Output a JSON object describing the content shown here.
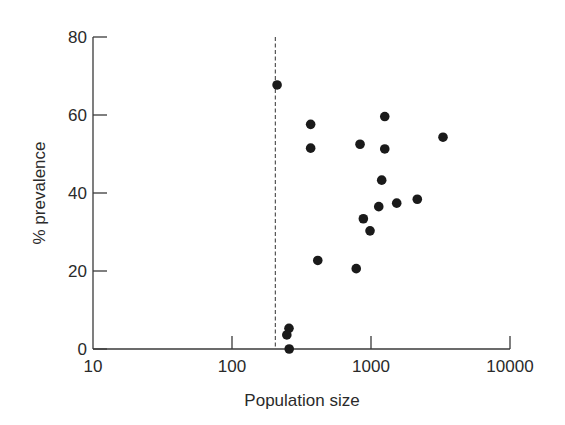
{
  "chart_data": {
    "type": "scatter",
    "title": "",
    "xlabel": "Population size",
    "ylabel": "% prevalence",
    "x_scale": "log",
    "xlim": [
      10,
      10000
    ],
    "ylim": [
      0,
      80
    ],
    "x_ticks": [
      10,
      100,
      1000,
      10000
    ],
    "x_tick_labels": [
      "10",
      "100",
      "1000",
      "10000"
    ],
    "y_ticks": [
      0,
      20,
      40,
      60,
      80
    ],
    "y_tick_labels": [
      "0",
      "20",
      "40",
      "60",
      "80"
    ],
    "grid": false,
    "legend": null,
    "threshold_line": {
      "orientation": "vertical",
      "style": "dashed",
      "x": 205
    },
    "series": [
      {
        "name": "populations",
        "marker": "filled-circle",
        "color": "#1a1a1a",
        "points": [
          {
            "x": 211,
            "y": 67.7
          },
          {
            "x": 368,
            "y": 57.6
          },
          {
            "x": 368,
            "y": 51.5
          },
          {
            "x": 1256,
            "y": 59.6
          },
          {
            "x": 834,
            "y": 52.5
          },
          {
            "x": 1256,
            "y": 51.3
          },
          {
            "x": 3296,
            "y": 54.3
          },
          {
            "x": 1194,
            "y": 43.3
          },
          {
            "x": 1137,
            "y": 36.5
          },
          {
            "x": 1531,
            "y": 37.4
          },
          {
            "x": 2153,
            "y": 38.4
          },
          {
            "x": 881,
            "y": 33.4
          },
          {
            "x": 984,
            "y": 30.3
          },
          {
            "x": 414,
            "y": 22.7
          },
          {
            "x": 783,
            "y": 20.6
          },
          {
            "x": 257,
            "y": 5.3
          },
          {
            "x": 248,
            "y": 3.6
          },
          {
            "x": 258,
            "y": 0.0
          }
        ]
      }
    ]
  },
  "colors": {
    "axis": "#3a3a3a",
    "marker": "#1a1a1a",
    "background": "#ffffff"
  }
}
